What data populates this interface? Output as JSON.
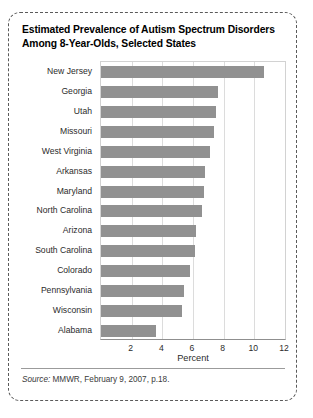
{
  "figure": {
    "title_line1": "Estimated Prevalence of Autism Spectrum Disorders",
    "title_line2": "Among 8-Year-Olds, Selected States",
    "source_label": "Source:",
    "source_text": " MMWR, February 9, 2007, p.18."
  },
  "chart_data": {
    "type": "bar",
    "orientation": "horizontal",
    "title": "Estimated Prevalence of Autism Spectrum Disorders Among 8-Year-Olds, Selected States",
    "xlabel": "Percent",
    "ylabel": "",
    "xlim": [
      0,
      12
    ],
    "xticks": [
      2,
      4,
      6,
      8,
      10,
      12
    ],
    "grid": true,
    "legend": null,
    "bar_color": "#919191",
    "categories": [
      "New Jersey",
      "Georgia",
      "Utah",
      "Missouri",
      "West Virginia",
      "Arkansas",
      "Maryland",
      "North Carolina",
      "Arizona",
      "South Carolina",
      "Colorado",
      "Pennsylvania",
      "Wisconsin",
      "Alabama"
    ],
    "values": [
      10.6,
      7.6,
      7.5,
      7.4,
      7.1,
      6.8,
      6.7,
      6.6,
      6.2,
      6.1,
      5.8,
      5.4,
      5.3,
      3.6
    ]
  }
}
